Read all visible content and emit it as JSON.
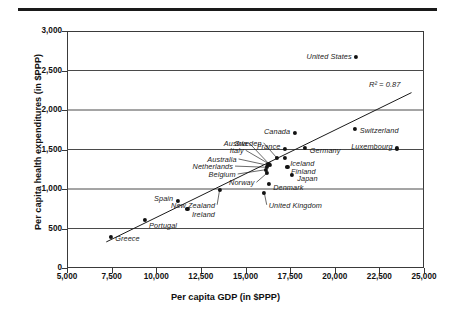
{
  "chart_data": {
    "type": "scatter",
    "title": "",
    "xlabel": "Per capita GDP (in $PPP)",
    "ylabel": "Per capita health expenditures (in $PPP)",
    "xlim": [
      5000,
      25000
    ],
    "ylim": [
      0,
      3000
    ],
    "xticks": [
      "5,000",
      "7,500",
      "10,000",
      "12,500",
      "15,000",
      "17,500",
      "20,000",
      "22,500",
      "25,000"
    ],
    "xtick_values": [
      5000,
      7500,
      10000,
      12500,
      15000,
      17500,
      20000,
      22500,
      25000
    ],
    "yticks": [
      "0",
      "500",
      "1,000",
      "1,500",
      "2,000",
      "2,500",
      "3,000"
    ],
    "ytick_values": [
      0,
      500,
      1000,
      1500,
      2000,
      2500,
      3000
    ],
    "grid": "horizontal",
    "legend": "none",
    "annotations": [
      {
        "text": "R² = 0.87",
        "x": 23600,
        "y": 2320
      }
    ],
    "trendline": {
      "x0": 7200,
      "y0": 330,
      "x1": 24300,
      "y1": 2220
    },
    "points": [
      {
        "label": "Greece",
        "x": 7450,
        "y": 395,
        "lx": 7700,
        "ly": 375,
        "anchor": "left"
      },
      {
        "label": "Portugal",
        "x": 9350,
        "y": 605,
        "lx": 9600,
        "ly": 540,
        "anchor": "left"
      },
      {
        "label": "Ireland",
        "x": 11750,
        "y": 745,
        "lx": 12000,
        "ly": 685,
        "anchor": "left"
      },
      {
        "label": "Spain",
        "x": 11200,
        "y": 845,
        "lx": 10950,
        "ly": 880,
        "anchor": "right"
      },
      {
        "label": "New Zealand",
        "x": 13550,
        "y": 990,
        "lx": 13300,
        "ly": 800,
        "anchor": "right"
      },
      {
        "label": "United Kingdom",
        "x": 16050,
        "y": 955,
        "lx": 16300,
        "ly": 800,
        "anchor": "left"
      },
      {
        "label": "Denmark",
        "x": 16300,
        "y": 1060,
        "lx": 16550,
        "ly": 1030,
        "anchor": "left"
      },
      {
        "label": "Norway",
        "x": 16200,
        "y": 1200,
        "lx": 15500,
        "ly": 1085,
        "anchor": "right"
      },
      {
        "label": "Belgium",
        "x": 16150,
        "y": 1245,
        "lx": 14450,
        "ly": 1190,
        "anchor": "right"
      },
      {
        "label": "Netherlands",
        "x": 16200,
        "y": 1275,
        "lx": 14300,
        "ly": 1290,
        "anchor": "right"
      },
      {
        "label": "Australia",
        "x": 16250,
        "y": 1300,
        "lx": 14500,
        "ly": 1380,
        "anchor": "right"
      },
      {
        "label": "Italy",
        "x": 16300,
        "y": 1320,
        "lx": 14900,
        "ly": 1490,
        "anchor": "right"
      },
      {
        "label": "Austria",
        "x": 16350,
        "y": 1310,
        "lx": 15100,
        "ly": 1580,
        "anchor": "right"
      },
      {
        "label": "Sweden",
        "x": 16750,
        "y": 1395,
        "lx": 15900,
        "ly": 1585,
        "anchor": "right"
      },
      {
        "label": "Finland",
        "x": 17350,
        "y": 1275,
        "lx": 17550,
        "ly": 1230,
        "anchor": "left"
      },
      {
        "label": "Iceland",
        "x": 17200,
        "y": 1395,
        "lx": 17500,
        "ly": 1330,
        "anchor": "left"
      },
      {
        "label": "Japan",
        "x": 17600,
        "y": 1180,
        "lx": 17900,
        "ly": 1140,
        "anchor": "left"
      },
      {
        "label": "France",
        "x": 17200,
        "y": 1510,
        "lx": 16950,
        "ly": 1550,
        "anchor": "right"
      },
      {
        "label": "Canada",
        "x": 17750,
        "y": 1715,
        "lx": 17500,
        "ly": 1740,
        "anchor": "right"
      },
      {
        "label": "Germany",
        "x": 18350,
        "y": 1520,
        "lx": 18600,
        "ly": 1490,
        "anchor": "left"
      },
      {
        "label": "Switzerland",
        "x": 21150,
        "y": 1765,
        "lx": 21400,
        "ly": 1745,
        "anchor": "left"
      },
      {
        "label": "Luxembourg",
        "x": 23500,
        "y": 1515,
        "lx": 23250,
        "ly": 1545,
        "anchor": "right"
      },
      {
        "label": "United States",
        "x": 21200,
        "y": 2670,
        "lx": 20950,
        "ly": 2685,
        "anchor": "right"
      }
    ]
  }
}
